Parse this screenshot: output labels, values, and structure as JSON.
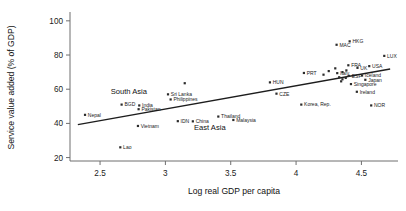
{
  "chart_data": {
    "type": "scatter",
    "title": "",
    "xlabel": "Log real GDP per capita",
    "ylabel": "Service value added (% of GDP)",
    "xlim": [
      2.27,
      4.78
    ],
    "ylim": [
      18,
      104
    ],
    "xticks": [
      "2.5",
      "3",
      "3.5",
      "4",
      "4.5"
    ],
    "xtick_values": [
      2.5,
      3.0,
      3.5,
      4.0,
      4.5
    ],
    "yticks": [
      "20",
      "40",
      "60",
      "80",
      "100"
    ],
    "ytick_values": [
      20,
      40,
      60,
      80,
      100
    ],
    "grid": false,
    "legend": "none",
    "trend_line": {
      "label": "fitted regression line",
      "x_start": 2.33,
      "y_start": 39.3,
      "x_end": 4.72,
      "y_end": 71.8
    },
    "annotations": [
      {
        "text": "South Asia",
        "x": 2.72,
        "y": 57.0
      },
      {
        "text": "East Asia",
        "x": 3.34,
        "y": 36.4
      }
    ],
    "points": [
      {
        "label": "Nepal",
        "x": 2.385,
        "y": 45.0,
        "label_pos": "right"
      },
      {
        "label": "BGD",
        "x": 2.665,
        "y": 51.0,
        "label_pos": "right"
      },
      {
        "label": "India",
        "x": 2.8,
        "y": 50.5,
        "label_pos": "right"
      },
      {
        "label": "Pakistan",
        "x": 2.795,
        "y": 48.3,
        "label_pos": "right"
      },
      {
        "label": "Lao",
        "x": 2.655,
        "y": 26.0,
        "label_pos": "right"
      },
      {
        "label": "Vietnam",
        "x": 2.79,
        "y": 38.5,
        "label_pos": "right"
      },
      {
        "label": "Sri Lanka",
        "x": 3.02,
        "y": 57.0,
        "label_pos": "right"
      },
      {
        "label": "Philippines",
        "x": 3.04,
        "y": 54.0,
        "label_pos": "right"
      },
      {
        "label": "IDN",
        "x": 3.095,
        "y": 41.3,
        "label_pos": "right"
      },
      {
        "label": "China",
        "x": 3.21,
        "y": 41.2,
        "label_pos": "right"
      },
      {
        "label": "Thailand",
        "x": 3.405,
        "y": 44.0,
        "label_pos": "right"
      },
      {
        "label": "Malaysia",
        "x": 3.52,
        "y": 42.0,
        "label_pos": "right"
      },
      {
        "label": "",
        "x": 3.148,
        "y": 63.5,
        "label_pos": "none"
      },
      {
        "label": "HUN",
        "x": 3.8,
        "y": 64.0,
        "label_pos": "right"
      },
      {
        "label": "CZE",
        "x": 3.85,
        "y": 57.4,
        "label_pos": "right"
      },
      {
        "label": "Korea, Rep.",
        "x": 4.04,
        "y": 51.0,
        "label_pos": "right"
      },
      {
        "label": "PRT",
        "x": 4.06,
        "y": 69.5,
        "label_pos": "right"
      },
      {
        "label": "",
        "x": 4.21,
        "y": 68.5,
        "label_pos": "none"
      },
      {
        "label": "MAC",
        "x": 4.31,
        "y": 86.0,
        "label_pos": "right"
      },
      {
        "label": "HKG",
        "x": 4.41,
        "y": 88.0,
        "label_pos": "right"
      },
      {
        "label": "LUX",
        "x": 4.675,
        "y": 79.5,
        "label_pos": "right"
      },
      {
        "label": "Italy",
        "x": 4.315,
        "y": 69.4,
        "label_pos": "right"
      },
      {
        "label": "FRA",
        "x": 4.4,
        "y": 74.0,
        "label_pos": "right"
      },
      {
        "label": "UK",
        "x": 4.47,
        "y": 72.5,
        "label_pos": "right"
      },
      {
        "label": "USA",
        "x": 4.56,
        "y": 73.5,
        "label_pos": "right"
      },
      {
        "label": "ESP",
        "x": 4.405,
        "y": 67.8,
        "label_pos": "right"
      },
      {
        "label": "Iceland",
        "x": 4.505,
        "y": 68.0,
        "label_pos": "right"
      },
      {
        "label": "Japan",
        "x": 4.53,
        "y": 65.5,
        "label_pos": "right"
      },
      {
        "label": "Singapore",
        "x": 4.42,
        "y": 63.0,
        "label_pos": "right"
      },
      {
        "label": "Ireland",
        "x": 4.465,
        "y": 58.5,
        "label_pos": "right"
      },
      {
        "label": "NOR",
        "x": 4.575,
        "y": 50.5,
        "label_pos": "right"
      },
      {
        "label": "",
        "x": 4.385,
        "y": 71.0,
        "label_pos": "none"
      },
      {
        "label": "",
        "x": 4.355,
        "y": 70.0,
        "label_pos": "none"
      },
      {
        "label": "",
        "x": 4.33,
        "y": 67.0,
        "label_pos": "none"
      },
      {
        "label": "",
        "x": 4.355,
        "y": 65.8,
        "label_pos": "none"
      },
      {
        "label": "",
        "x": 4.38,
        "y": 66.6,
        "label_pos": "none"
      },
      {
        "label": "",
        "x": 4.345,
        "y": 64.6,
        "label_pos": "none"
      },
      {
        "label": "",
        "x": 4.3,
        "y": 72.2,
        "label_pos": "none"
      },
      {
        "label": "",
        "x": 4.25,
        "y": 70.6,
        "label_pos": "none"
      }
    ]
  }
}
